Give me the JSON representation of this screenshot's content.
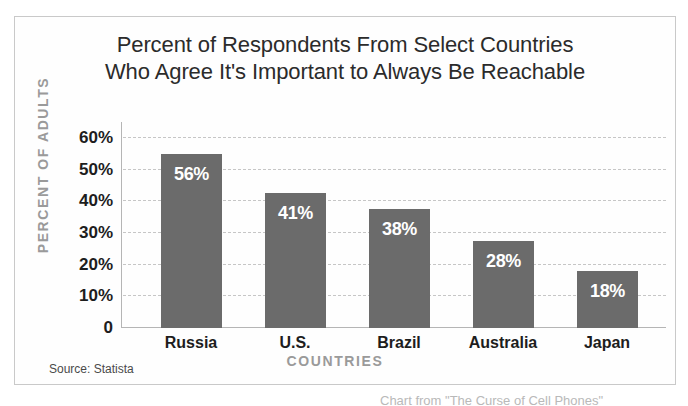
{
  "chart_data": {
    "type": "bar",
    "title": "Percent of Respondents From Select Countries Who Agree It's Important to Always Be Reachable",
    "title_line1": "Percent of Respondents From Select Countries",
    "title_line2": "Who Agree It's Important to Always Be Reachable",
    "xlabel": "COUNTRIES",
    "ylabel": "PERCENT OF ADULTS",
    "categories": [
      "Russia",
      "U.S.",
      "Brazil",
      "Australia",
      "Japan"
    ],
    "values": [
      56,
      41,
      38,
      28,
      18
    ],
    "value_labels": [
      "56%",
      "41%",
      "38%",
      "28%",
      "18%"
    ],
    "bar_plotted_heights": [
      55,
      42.5,
      37.5,
      27.5,
      18
    ],
    "ylim": [
      0,
      65
    ],
    "yticks": [
      0,
      10,
      20,
      30,
      40,
      50,
      60
    ],
    "ytick_labels": [
      "0",
      "10%",
      "20%",
      "30%",
      "40%",
      "50%",
      "60%"
    ],
    "grid": "horizontal-dashed",
    "legend": "none",
    "bar_color": "#6b6b6b",
    "gridline_color": "#c6c6c6",
    "axis_title_color": "#9a9a9a",
    "value_label_color": "#ffffff"
  },
  "source": {
    "text": "Source: Statista"
  },
  "caption": {
    "partial_text": "Chart from \"The Curse of Cell Phones\""
  }
}
